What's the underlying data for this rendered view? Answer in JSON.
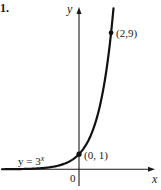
{
  "problem_number": "1.",
  "chart_data": {
    "type": "line",
    "title": "",
    "function_label": "y = 3",
    "function_exponent": "x",
    "xlabel": "x",
    "ylabel": "y",
    "origin_label": "0",
    "xlim": [
      -4.8,
      4.8
    ],
    "ylim": [
      -1.1,
      10.9
    ],
    "grid": false,
    "series": [
      {
        "name": "y = 3^x",
        "base": 3,
        "x_range": [
          -4.8,
          2.15
        ]
      }
    ],
    "points": [
      {
        "x": 0,
        "y": 1,
        "label": "(0, 1)"
      },
      {
        "x": 2,
        "y": 9,
        "label": "(2,9)"
      }
    ]
  }
}
